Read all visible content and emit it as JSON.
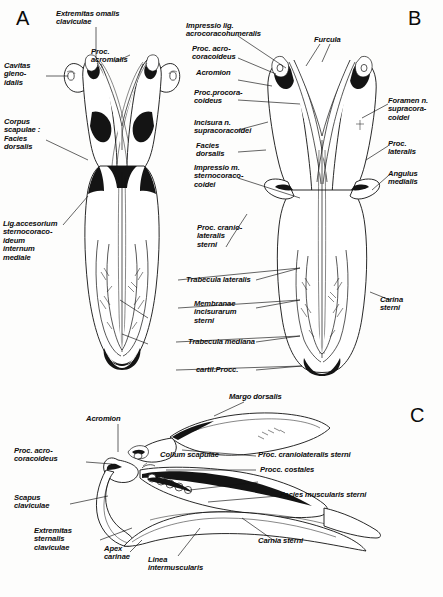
{
  "figure": {
    "title_ghost": "",
    "panels": [
      {
        "id": "A",
        "letter": "A",
        "view": "ventral view of pectoral girdle and sternum"
      },
      {
        "id": "B",
        "letter": "B",
        "view": "dorsal view of pectoral girdle and sternum with furcula"
      },
      {
        "id": "C",
        "letter": "C",
        "view": "lateral view of pectoral girdle and sternum"
      }
    ]
  },
  "panel_a": {
    "letter": "A",
    "labels": {
      "extremitas_omalis": "Extremitas omalis\nclaviculae",
      "proc_acromialis": "Proc.\nacromialis",
      "cavitas_glenoidalis": "Cavitas\ngleno-\nidalis",
      "corpus_scapulae": "Corpus\nscapulae :\nFacies\ndorsalis",
      "lig_accesorium": "Lig.accesorium\nsternocoraco-\nideum\ninternum\nmediale"
    }
  },
  "panel_b": {
    "letter": "B",
    "labels": {
      "impressio_lig": "Impressio lig.\nacrocoracohumeralis",
      "proc_acrocoracoideus": "Proc. acro-\ncoracoideus",
      "acromion": "Acromion",
      "proc_procoracoideus": "Proc.procora-\ncoideus",
      "incisura_n": "Incisura n.\nsupracoracoidei",
      "facies_dorsalis": "Facies\ndorsalis",
      "impressio_m": "Impressio m.\nsternocoraco-\ncoidei",
      "furcula": "Furcula",
      "foramen_n": "Foramen n.\nsupracora-\ncoidei",
      "proc_lateralis": "Proc.\nlateralis",
      "angulus_medialis": "Angulus\nmedialis",
      "carina_sterni": "Carina\nsterni"
    }
  },
  "panel_shared": {
    "labels": {
      "proc_craniolateralis": "Proc. cranio-\nlateralis\nsterni",
      "trabecula_lateralis": "Trabecula lateralis",
      "membranae": "Membranae\nincisurarum\nsterni",
      "trabecula_mediana": "Trabecula mediana",
      "cartil_procc": "cartil.Procc."
    }
  },
  "panel_c": {
    "letter": "C",
    "labels": {
      "acromion": "Acromion",
      "margo_dorsalis": "Margo dorsalis",
      "proc_acrocoracoideus": "Proc. acro-\ncoracoideus",
      "collum_scapulae": "Collum scapulae",
      "proc_craniolateralis_sterni": "Proc. craniolateralis sterni",
      "procc_costales": "Procc. costales",
      "facies_muscularis": "Facies muscularis sterni",
      "scapus_claviculae": "Scapus\nclaviculae",
      "extremitas_sternalis": "Extremitas\nsternalis\nclaviculae",
      "apex_carinae": "Apex\ncarinae",
      "linea_intermuscularis": "Linea\nintermuscularis",
      "carnia_sterni": "Carnia sterni"
    }
  },
  "colors": {
    "ink": "#111111",
    "paper": "#fdfdfc",
    "ghost": "#b9b9b9"
  }
}
